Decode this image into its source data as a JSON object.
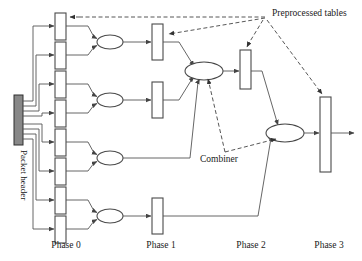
{
  "figure": {
    "title_text": "",
    "labels": {
      "preprocessed_tables": "Preprocessed tables",
      "combiner": "Combiner",
      "packet_header": "Packet header"
    },
    "phases": [
      {
        "id": "phase0",
        "label": "Phase 0",
        "x": 66,
        "label_x": 66,
        "boxes": 8
      },
      {
        "id": "phase1",
        "label": "Phase 1",
        "x": 161,
        "label_x": 161,
        "boxes": 4
      },
      {
        "id": "phase2",
        "label": "Phase 2",
        "x": 251,
        "label_x": 251,
        "boxes": 1
      },
      {
        "id": "phase3",
        "label": "Phase 3",
        "x": 329,
        "label_x": 329,
        "boxes": 1
      }
    ],
    "colors": {
      "stroke": "#4a4a4a",
      "wire": "#555555",
      "dash": "#444444",
      "header_fill": "#888888",
      "box_fill": "#ffffff",
      "text": "#1a1a1a",
      "background": "#ffffff"
    },
    "phase0_boxes": [
      {
        "index": 0,
        "x": 55,
        "y": 13,
        "w": 11,
        "h": 27
      },
      {
        "index": 1,
        "x": 55,
        "y": 42,
        "w": 11,
        "h": 27
      },
      {
        "index": 2,
        "x": 55,
        "y": 71,
        "w": 11,
        "h": 27
      },
      {
        "index": 3,
        "x": 55,
        "y": 100,
        "w": 11,
        "h": 27
      },
      {
        "index": 4,
        "x": 55,
        "y": 129,
        "w": 11,
        "h": 27
      },
      {
        "index": 5,
        "x": 55,
        "y": 158,
        "w": 11,
        "h": 27
      },
      {
        "index": 6,
        "x": 55,
        "y": 187,
        "w": 11,
        "h": 27
      },
      {
        "index": 7,
        "x": 55,
        "y": 216,
        "w": 11,
        "h": 27
      }
    ],
    "phase0_ellipses": [
      {
        "index": 0,
        "cx": 110,
        "cy": 42,
        "rx": 13,
        "ry": 7
      },
      {
        "index": 1,
        "cx": 110,
        "cy": 100,
        "rx": 13,
        "ry": 7
      },
      {
        "index": 2,
        "cx": 110,
        "cy": 158,
        "rx": 13,
        "ry": 7
      },
      {
        "index": 3,
        "cx": 110,
        "cy": 216,
        "rx": 13,
        "ry": 7
      }
    ],
    "phase1_boxes": [
      {
        "index": 0,
        "x": 152,
        "y": 24,
        "w": 11,
        "h": 36
      },
      {
        "index": 1,
        "x": 152,
        "y": 82,
        "w": 11,
        "h": 36
      },
      {
        "index": 2,
        "x": 152,
        "y": 198,
        "w": 11,
        "h": 36
      }
    ],
    "phase2_combiner": {
      "cx": 204,
      "cy": 71,
      "rx": 19,
      "ry": 9
    },
    "phase2_boxes": [
      {
        "index": 0,
        "x": 240,
        "y": 50,
        "w": 11,
        "h": 39
      }
    ],
    "phase3_combiner": {
      "cx": 285,
      "cy": 133,
      "rx": 19,
      "ry": 9
    },
    "phase3_boxes": [
      {
        "index": 0,
        "x": 320,
        "y": 97,
        "w": 11,
        "h": 75
      }
    ],
    "packet_header_bar": {
      "x": 14,
      "y": 95,
      "w": 9,
      "h": 50
    },
    "dash_hub": {
      "x": 265,
      "y": 17
    },
    "output_arrow": {
      "x1": 331,
      "y1": 133,
      "x2": 355,
      "y2": 133
    }
  }
}
